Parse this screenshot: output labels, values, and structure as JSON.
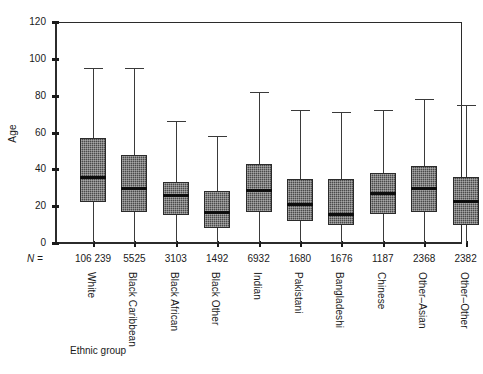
{
  "chart_data": {
    "type": "box",
    "title": "",
    "xlabel": "Ethnic group",
    "ylabel": "Age",
    "ylim": [
      0,
      120
    ],
    "yticks": [
      0,
      20,
      40,
      60,
      80,
      100,
      120
    ],
    "ytick_labels": [
      "0",
      "20",
      "40",
      "60",
      "80",
      "100",
      "120"
    ],
    "grid": false,
    "legend": "none",
    "n_label": "N =",
    "categories": [
      "White",
      "Black Caribbean",
      "Black African",
      "Black Other",
      "Indian",
      "Pakistani",
      "Bangladeshi",
      "Chinese",
      "Other–Asian",
      "Other–Other"
    ],
    "n_values": [
      "106 239",
      "5525",
      "3103",
      "1492",
      "6932",
      "1680",
      "1676",
      "1187",
      "2368",
      "2382"
    ],
    "boxes": [
      {
        "category": "White",
        "n": "106 239",
        "whisker_low": 0,
        "q1": 22,
        "median": 36,
        "q3": 57,
        "whisker_high": 95
      },
      {
        "category": "Black Caribbean",
        "n": "5525",
        "whisker_low": 0,
        "q1": 17,
        "median": 30,
        "q3": 48,
        "whisker_high": 95
      },
      {
        "category": "Black African",
        "n": "3103",
        "whisker_low": 0,
        "q1": 15,
        "median": 26,
        "q3": 33,
        "whisker_high": 66
      },
      {
        "category": "Black Other",
        "n": "1492",
        "whisker_low": 0,
        "q1": 8,
        "median": 17,
        "q3": 28,
        "whisker_high": 58
      },
      {
        "category": "Indian",
        "n": "6932",
        "whisker_low": 0,
        "q1": 17,
        "median": 29,
        "q3": 43,
        "whisker_high": 82
      },
      {
        "category": "Pakistani",
        "n": "1680",
        "whisker_low": 0,
        "q1": 12,
        "median": 21,
        "q3": 35,
        "whisker_high": 72
      },
      {
        "category": "Bangladeshi",
        "n": "1676",
        "whisker_low": 0,
        "q1": 10,
        "median": 16,
        "q3": 35,
        "whisker_high": 71
      },
      {
        "category": "Chinese",
        "n": "1187",
        "whisker_low": 0,
        "q1": 16,
        "median": 27,
        "q3": 38,
        "whisker_high": 72
      },
      {
        "category": "Other–Asian",
        "n": "2368",
        "whisker_low": 0,
        "q1": 17,
        "median": 30,
        "q3": 42,
        "whisker_high": 78
      },
      {
        "category": "Other–Other",
        "n": "2382",
        "whisker_low": 0,
        "q1": 10,
        "median": 23,
        "q3": 36,
        "whisker_high": 75
      }
    ],
    "colors": {
      "box_fill": "#4a4a4a",
      "box_edge": "#2b2b2b",
      "median": "#0d0d0d",
      "whisker": "#3a3a3a",
      "axis": "#2b2b2b",
      "background": "#ffffff"
    }
  }
}
